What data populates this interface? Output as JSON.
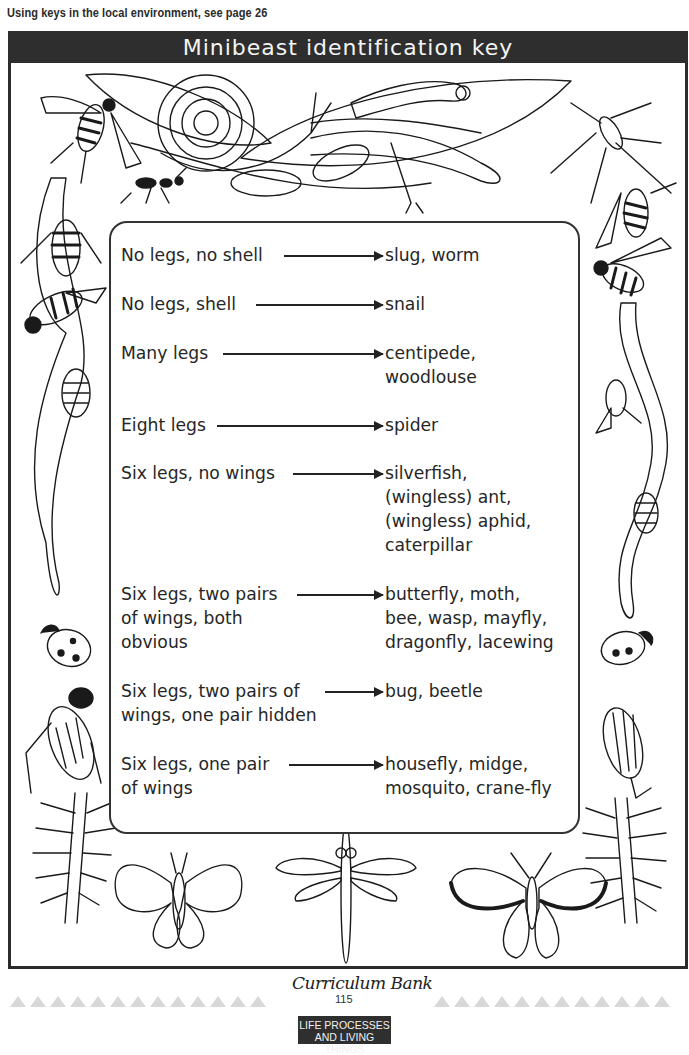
{
  "header": {
    "note": "Using keys in the local environment, see page 26"
  },
  "title": "Minibeast identification key",
  "key": [
    {
      "question": "No legs, no shell",
      "answer": "slug, worm"
    },
    {
      "question": "No legs, shell",
      "answer": "snail"
    },
    {
      "question": "Many legs",
      "answer": "centipede,\nwoodlouse"
    },
    {
      "question": "Eight legs",
      "answer": "spider"
    },
    {
      "question": "Six legs, no wings",
      "answer": "silverfish,\n(wingless) ant,\n(wingless) aphid,\ncaterpillar"
    },
    {
      "question": "Six legs, two pairs\nof wings, both\nobvious",
      "answer": "butterfly, moth,\nbee, wasp, mayfly,\ndragonfly, lacewing"
    },
    {
      "question": "Six legs, two pairs of\nwings, one pair hidden",
      "answer": "bug, beetle"
    },
    {
      "question": "Six legs, one pair\nof wings",
      "answer": "housefly, midge,\nmosquito, crane-fly"
    }
  ],
  "illustrations": {
    "top": [
      "wasp",
      "snail",
      "slug",
      "caterpillar",
      "worm",
      "woodlouse",
      "ant",
      "leaf",
      "crane-fly"
    ],
    "left": [
      "worm",
      "bee",
      "wasp",
      "woodlouse",
      "ladybird",
      "ground-beetle",
      "centipede"
    ],
    "right": [
      "hoverfly",
      "bee",
      "worm",
      "housefly",
      "woodlouse",
      "ladybird",
      "click-beetle",
      "centipede"
    ],
    "bottom": [
      "moth",
      "dragonfly",
      "butterfly"
    ]
  },
  "footer": {
    "logo": "Curriculum Bank",
    "page_number": "115",
    "section_line1": "LIFE PROCESSES",
    "section_line2": "AND LIVING THINGS"
  }
}
